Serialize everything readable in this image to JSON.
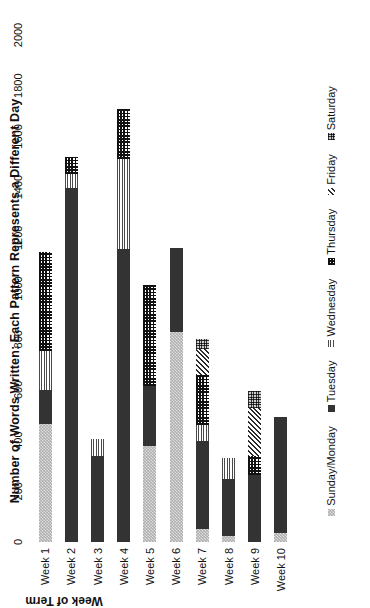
{
  "chart_data": {
    "type": "bar",
    "orientation": "horizontal",
    "stacked": true,
    "title": "Number of Words Written: Each Pattern Represents a Different Day",
    "xlabel": "",
    "ylabel": "Week of Term",
    "categories": [
      "Week 1",
      "Week 2",
      "Week 3",
      "Week 4",
      "Week 5",
      "Week 6",
      "Week 7",
      "Week 8",
      "Week 9",
      "Week 10"
    ],
    "value_axis_ticks": [
      0,
      200,
      400,
      600,
      800,
      1000,
      1200,
      1400,
      1600,
      1800,
      2000
    ],
    "xlim": [
      0,
      2000
    ],
    "grid": false,
    "legend_position": "bottom",
    "series": [
      {
        "name": "Sunday/Monday",
        "pattern": "light-gray-fine-checker",
        "values": [
          465,
          0,
          0,
          0,
          380,
          830,
          50,
          25,
          0,
          35
        ]
      },
      {
        "name": "Tuesday",
        "pattern": "solid-dark",
        "values": [
          135,
          1395,
          340,
          1155,
          235,
          330,
          350,
          225,
          265,
          460
        ]
      },
      {
        "name": "Wednesday",
        "pattern": "horizontal-lines",
        "values": [
          155,
          55,
          65,
          355,
          0,
          0,
          60,
          80,
          0,
          0
        ]
      },
      {
        "name": "Thursday",
        "pattern": "checkerboard",
        "values": [
          390,
          70,
          0,
          200,
          400,
          0,
          200,
          0,
          75,
          0
        ]
      },
      {
        "name": "Friday",
        "pattern": "diagonal-hatch",
        "values": [
          0,
          0,
          0,
          0,
          0,
          0,
          100,
          0,
          190,
          0
        ]
      },
      {
        "name": "Saturday",
        "pattern": "fine-dots",
        "values": [
          0,
          0,
          0,
          0,
          0,
          0,
          40,
          0,
          65,
          0
        ]
      }
    ],
    "totals": [
      1145,
      1520,
      405,
      1710,
      1015,
      1160,
      800,
      330,
      595,
      495
    ]
  },
  "colors": {
    "sunday_monday": "#b0b0b0",
    "tuesday": "#333333",
    "wednesday": "#4a4a4a",
    "thursday": "#111111",
    "friday": "#2b2b2b",
    "saturday": "#cfcfcf",
    "background": "#ffffff",
    "text": "#111111"
  }
}
